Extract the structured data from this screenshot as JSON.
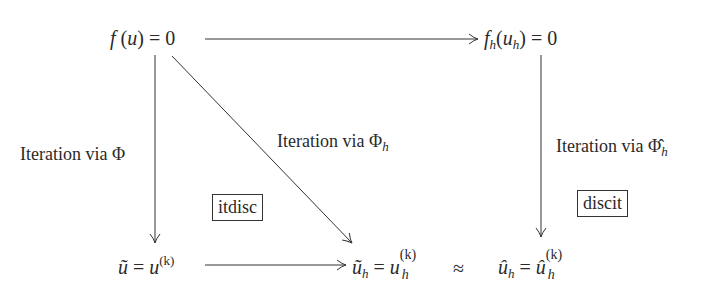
{
  "diagram": {
    "type": "commutative-diagram",
    "nodes": {
      "top_left": {
        "id": "continuous-equation",
        "text": "f (u) = 0"
      },
      "top_right": {
        "id": "discrete-equation",
        "text": "f_h(u_h) = 0"
      },
      "bottom_left": {
        "id": "continuous-iterate",
        "text": "ũ = u^(k)"
      },
      "bottom_middle": {
        "id": "discretized-iterate",
        "text": "ũ_h = u_h^(k)"
      },
      "bottom_right": {
        "id": "discrete-iterate",
        "text": "û_h = û_h^(k)"
      }
    },
    "edges": [
      {
        "from": "top_left",
        "to": "top_right",
        "label": ""
      },
      {
        "from": "top_left",
        "to": "bottom_left",
        "label": "Iteration via Φ"
      },
      {
        "from": "top_left",
        "to": "bottom_middle",
        "label": "Iteration via Φ_h"
      },
      {
        "from": "top_right",
        "to": "bottom_right",
        "label": "Iteration via Φ̂_h"
      },
      {
        "from": "bottom_left",
        "to": "bottom_middle",
        "label": ""
      }
    ],
    "relation_symbol": "≈",
    "boxes": {
      "left": "itdisc",
      "right": "discit"
    },
    "labels": {
      "prefix": "Iteration via ",
      "phi": "Φ",
      "phi_hat": "Φ̂",
      "sub_h": "h",
      "sup_k": "(k)"
    },
    "symbols": {
      "f": "f",
      "u": "u",
      "u_tilde": "ũ",
      "u_hat": "û",
      "equals_zero": "= 0",
      "equals": "=",
      "open_paren": "(",
      "close_paren": ")"
    },
    "stroke_color": "#333333"
  }
}
